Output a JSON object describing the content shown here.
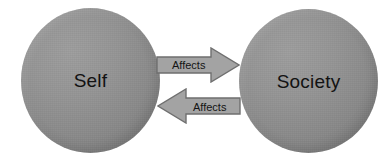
{
  "diagram": {
    "background_color": "#ffffff",
    "nodes": [
      {
        "id": "self",
        "label": "Self",
        "shape": "sphere",
        "fill_color": "#8e8e8e",
        "text_color": "#121212"
      },
      {
        "id": "society",
        "label": "Society",
        "shape": "sphere",
        "fill_color": "#8e8e8e",
        "text_color": "#121212"
      }
    ],
    "edges": [
      {
        "id": "self-to-society",
        "label": "Affects",
        "direction": "right",
        "from": "self",
        "to": "society",
        "fill_color": "#a3a3a3",
        "outline_color": "#6f6f6f",
        "text_color": "#141414"
      },
      {
        "id": "society-to-self",
        "label": "Affects",
        "direction": "left",
        "from": "society",
        "to": "self",
        "fill_color": "#a3a3a3",
        "outline_color": "#6f6f6f",
        "text_color": "#141414"
      }
    ]
  }
}
